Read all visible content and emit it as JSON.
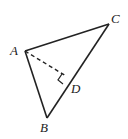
{
  "diagram": {
    "type": "triangle-with-altitude",
    "colors": {
      "stroke": "#222222",
      "background": "#ffffff"
    },
    "points": {
      "A": {
        "label": "A",
        "x": 25,
        "y": 51,
        "label_x": 10,
        "label_y": 55
      },
      "B": {
        "label": "B",
        "x": 47,
        "y": 118,
        "label_x": 40,
        "label_y": 132
      },
      "C": {
        "label": "C",
        "x": 109,
        "y": 24,
        "label_x": 111,
        "label_y": 23
      },
      "D": {
        "label": "D",
        "x": 66,
        "y": 85,
        "label_x": 71,
        "label_y": 93
      }
    },
    "segments": [
      {
        "from": "A",
        "to": "C",
        "style": "solid"
      },
      {
        "from": "A",
        "to": "B",
        "style": "solid"
      },
      {
        "from": "B",
        "to": "C",
        "style": "solid"
      },
      {
        "from": "A",
        "to": "D",
        "style": "dashed"
      }
    ],
    "right_angle_mark": {
      "at": "D"
    }
  }
}
